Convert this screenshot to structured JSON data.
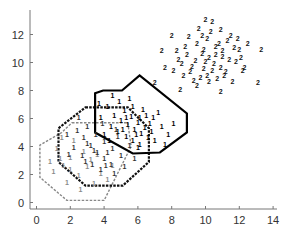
{
  "chart_data": {
    "type": "scatter",
    "title": "",
    "xlabel": "",
    "ylabel": "",
    "xlim": [
      -0.4,
      14
    ],
    "ylim": [
      -0.5,
      13.7
    ],
    "xticks": [
      0,
      2,
      4,
      6,
      8,
      10,
      12,
      14
    ],
    "yticks": [
      0,
      2,
      4,
      6,
      8,
      10,
      12
    ],
    "grid": false,
    "legend": "none",
    "series": [
      {
        "name": "class 2",
        "marker": "2",
        "color": "#111111",
        "points": [
          [
            10.2,
            10.3
          ],
          [
            9.8,
            10.6
          ],
          [
            10.5,
            9.9
          ],
          [
            11.0,
            10.8
          ],
          [
            9.4,
            10.1
          ],
          [
            10.8,
            11.3
          ],
          [
            10.1,
            11.7
          ],
          [
            9.2,
            9.7
          ],
          [
            11.4,
            10.2
          ],
          [
            10.6,
            10.5
          ],
          [
            9.9,
            9.5
          ],
          [
            10.9,
            9.6
          ],
          [
            8.9,
            10.5
          ],
          [
            11.7,
            11.0
          ],
          [
            10.3,
            12.2
          ],
          [
            9.5,
            11.3
          ],
          [
            8.6,
            9.9
          ],
          [
            10.0,
            10.0
          ],
          [
            11.2,
            9.3
          ],
          [
            9.7,
            8.9
          ],
          [
            10.7,
            8.8
          ],
          [
            12.1,
            10.3
          ],
          [
            8.3,
            10.8
          ],
          [
            9.0,
            11.8
          ],
          [
            10.4,
            12.9
          ],
          [
            11.9,
            11.7
          ],
          [
            9.3,
            8.7
          ],
          [
            10.9,
            12.3
          ],
          [
            12.3,
            9.6
          ],
          [
            8.1,
            9.4
          ],
          [
            11.5,
            11.9
          ],
          [
            9.6,
            12.4
          ],
          [
            10.2,
            8.6
          ],
          [
            11.1,
            9.0
          ],
          [
            8.7,
            9.0
          ],
          [
            12.0,
            10.9
          ],
          [
            9.1,
            9.3
          ],
          [
            10.6,
            11.1
          ],
          [
            11.3,
            11.5
          ],
          [
            9.9,
            10.9
          ],
          [
            10.4,
            9.4
          ],
          [
            8.8,
            11.1
          ],
          [
            12.5,
            11.3
          ],
          [
            13.1,
            8.5
          ],
          [
            7.0,
            8.5
          ],
          [
            7.4,
            10.8
          ],
          [
            8.0,
            11.9
          ],
          [
            10.0,
            13.0
          ],
          [
            13.3,
            10.9
          ],
          [
            11.6,
            8.6
          ],
          [
            9.5,
            8.3
          ],
          [
            8.5,
            8.0
          ],
          [
            10.9,
            7.9
          ],
          [
            12.2,
            9.4
          ],
          [
            7.6,
            9.6
          ],
          [
            11.8,
            10.0
          ],
          [
            8.4,
            10.2
          ],
          [
            10.1,
            9.0
          ],
          [
            9.8,
            11.9
          ],
          [
            11.0,
            10.4
          ]
        ]
      },
      {
        "name": "class 1 (outer, light)",
        "marker": "1",
        "color": "#8a8a8a",
        "points": [
          [
            1.2,
            3.8
          ],
          [
            1.6,
            2.6
          ],
          [
            2.0,
            3.2
          ],
          [
            2.5,
            1.9
          ],
          [
            1.0,
            2.2
          ],
          [
            3.0,
            2.5
          ],
          [
            2.2,
            4.4
          ],
          [
            3.4,
            1.3
          ],
          [
            1.8,
            1.4
          ],
          [
            2.8,
            3.6
          ],
          [
            3.8,
            2.0
          ],
          [
            1.4,
            3.1
          ],
          [
            4.2,
            1.6
          ],
          [
            2.6,
            0.9
          ],
          [
            3.2,
            3.0
          ],
          [
            0.8,
            2.9
          ],
          [
            4.5,
            2.6
          ],
          [
            2.0,
            2.3
          ],
          [
            3.6,
            3.4
          ],
          [
            1.5,
            4.6
          ]
        ]
      },
      {
        "name": "class 1 (middle)",
        "marker": "1",
        "color": "#333333",
        "points": [
          [
            2.8,
            4.6
          ],
          [
            3.2,
            4.0
          ],
          [
            3.6,
            3.5
          ],
          [
            4.0,
            3.1
          ],
          [
            4.4,
            2.7
          ],
          [
            2.4,
            5.1
          ],
          [
            3.0,
            5.4
          ],
          [
            3.5,
            4.8
          ],
          [
            4.0,
            4.3
          ],
          [
            4.5,
            3.8
          ],
          [
            5.0,
            3.3
          ],
          [
            2.2,
            3.9
          ],
          [
            2.7,
            3.3
          ],
          [
            3.3,
            2.7
          ],
          [
            3.8,
            2.3
          ],
          [
            4.6,
            2.0
          ],
          [
            5.2,
            2.5
          ],
          [
            1.8,
            4.8
          ],
          [
            2.5,
            6.0
          ],
          [
            3.9,
            5.6
          ],
          [
            4.8,
            4.7
          ],
          [
            5.5,
            4.0
          ],
          [
            3.0,
            4.2
          ],
          [
            3.4,
            3.7
          ],
          [
            4.2,
            3.5
          ],
          [
            4.1,
            2.6
          ],
          [
            2.9,
            2.9
          ],
          [
            5.8,
            3.1
          ],
          [
            1.9,
            3.4
          ],
          [
            4.7,
            5.2
          ]
        ]
      },
      {
        "name": "class 1 (inner, dense)",
        "marker": "1",
        "color": "#000000",
        "points": [
          [
            5.0,
            5.8
          ],
          [
            5.4,
            5.5
          ],
          [
            5.8,
            5.2
          ],
          [
            6.2,
            4.9
          ],
          [
            6.6,
            4.6
          ],
          [
            4.6,
            6.2
          ],
          [
            5.2,
            6.5
          ],
          [
            5.6,
            6.1
          ],
          [
            6.0,
            5.7
          ],
          [
            6.4,
            5.3
          ],
          [
            6.8,
            5.0
          ],
          [
            4.4,
            5.4
          ],
          [
            4.8,
            5.0
          ],
          [
            5.3,
            4.7
          ],
          [
            5.7,
            4.4
          ],
          [
            6.1,
            4.1
          ],
          [
            7.0,
            4.4
          ],
          [
            4.2,
            6.8
          ],
          [
            4.9,
            7.2
          ],
          [
            5.5,
            7.4
          ],
          [
            6.3,
            6.6
          ],
          [
            6.9,
            6.0
          ],
          [
            7.4,
            5.4
          ],
          [
            7.8,
            4.8
          ],
          [
            4.0,
            4.8
          ],
          [
            3.8,
            6.0
          ],
          [
            5.1,
            5.2
          ],
          [
            5.9,
            4.8
          ],
          [
            6.5,
            6.2
          ],
          [
            7.2,
            6.4
          ],
          [
            8.1,
            5.6
          ],
          [
            4.5,
            7.6
          ],
          [
            5.7,
            6.8
          ],
          [
            6.7,
            5.6
          ],
          [
            4.3,
            4.4
          ],
          [
            6.0,
            3.9
          ],
          [
            7.6,
            4.1
          ],
          [
            3.7,
            7.0
          ],
          [
            5.3,
            6.0
          ],
          [
            6.1,
            6.0
          ]
        ]
      }
    ],
    "regions": [
      {
        "name": "gray-dashed-octagon",
        "style": "dashed",
        "color": "#888888",
        "vertices": [
          [
            2.1,
            5.7
          ],
          [
            5.4,
            5.7
          ],
          [
            5.6,
            4.0
          ],
          [
            4.0,
            0.15
          ],
          [
            1.8,
            0.15
          ],
          [
            0.2,
            1.8
          ],
          [
            0.2,
            4.1
          ],
          [
            1.5,
            5.0
          ]
        ]
      },
      {
        "name": "black-dashed-octagon",
        "style": "dashed",
        "color": "#111111",
        "vertices": [
          [
            2.9,
            6.8
          ],
          [
            5.4,
            6.8
          ],
          [
            6.65,
            5.3
          ],
          [
            6.65,
            2.9
          ],
          [
            5.1,
            1.2
          ],
          [
            2.9,
            1.2
          ],
          [
            1.3,
            2.9
          ],
          [
            1.3,
            5.3
          ]
        ]
      },
      {
        "name": "solid-octagon",
        "style": "solid",
        "color": "#000000",
        "vertices": [
          [
            3.47,
            7.8
          ],
          [
            3.94,
            8.0
          ],
          [
            5.06,
            8.0
          ],
          [
            6.1,
            9.07
          ],
          [
            8.9,
            6.36
          ],
          [
            8.9,
            5.0
          ],
          [
            7.3,
            3.57
          ],
          [
            5.7,
            3.5
          ],
          [
            3.47,
            5.0
          ]
        ]
      }
    ]
  }
}
